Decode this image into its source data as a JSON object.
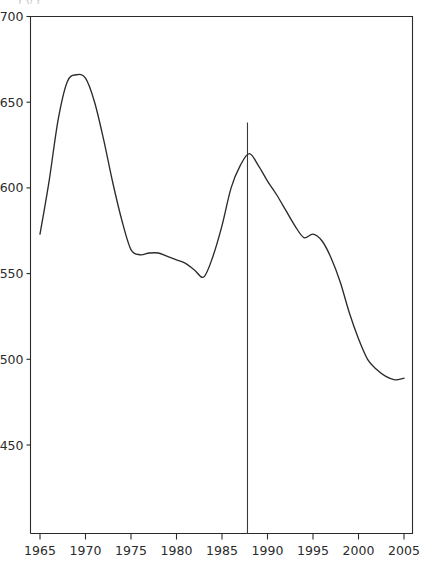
{
  "page": {
    "top_caption_partial": "j  y  j                                               ."
  },
  "chart_data": {
    "type": "line",
    "title": "",
    "subtitle": "",
    "xlabel": "",
    "ylabel": "",
    "xlim": [
      1964,
      2006
    ],
    "ylim": [
      430,
      700
    ],
    "grid": false,
    "legend": null,
    "x_ticks": [
      1965,
      1970,
      1975,
      1980,
      1985,
      1990,
      1995,
      2000,
      2005
    ],
    "x_tick_labels": [
      "1965",
      "1970",
      "1975",
      "1980",
      "1985",
      "1990",
      "1995",
      "2000",
      "2005"
    ],
    "y_ticks": [
      450,
      500,
      550,
      600,
      650,
      700
    ],
    "y_tick_labels": [
      "450",
      "500",
      "550",
      "600",
      "650",
      "700"
    ],
    "series": [
      {
        "name": "value",
        "color": "#2b2b2b",
        "x": [
          1965,
          1966,
          1967,
          1968,
          1969,
          1970,
          1971,
          1972,
          1973,
          1974,
          1975,
          1976,
          1977,
          1978,
          1979,
          1980,
          1981,
          1982,
          1983,
          1984,
          1985,
          1986,
          1987,
          1988,
          1989,
          1990,
          1991,
          1992,
          1993,
          1994,
          1995,
          1996,
          1997,
          1998,
          1999,
          2000,
          2001,
          2002,
          2003,
          2004,
          2005
        ],
        "values": [
          573,
          604,
          640,
          662,
          666,
          664,
          650,
          628,
          603,
          581,
          564,
          561,
          562,
          562,
          560,
          558,
          556,
          552,
          548,
          560,
          578,
          600,
          613,
          620,
          613,
          604,
          596,
          587,
          578,
          571,
          573,
          569,
          559,
          545,
          527,
          512,
          500,
          494,
          490,
          488,
          489
        ]
      }
    ],
    "annotations": [
      {
        "name": "event-marker-line",
        "type": "vertical-line",
        "x": 1987.8,
        "y_top": 700,
        "y_bottom": 430,
        "label": ""
      }
    ]
  }
}
